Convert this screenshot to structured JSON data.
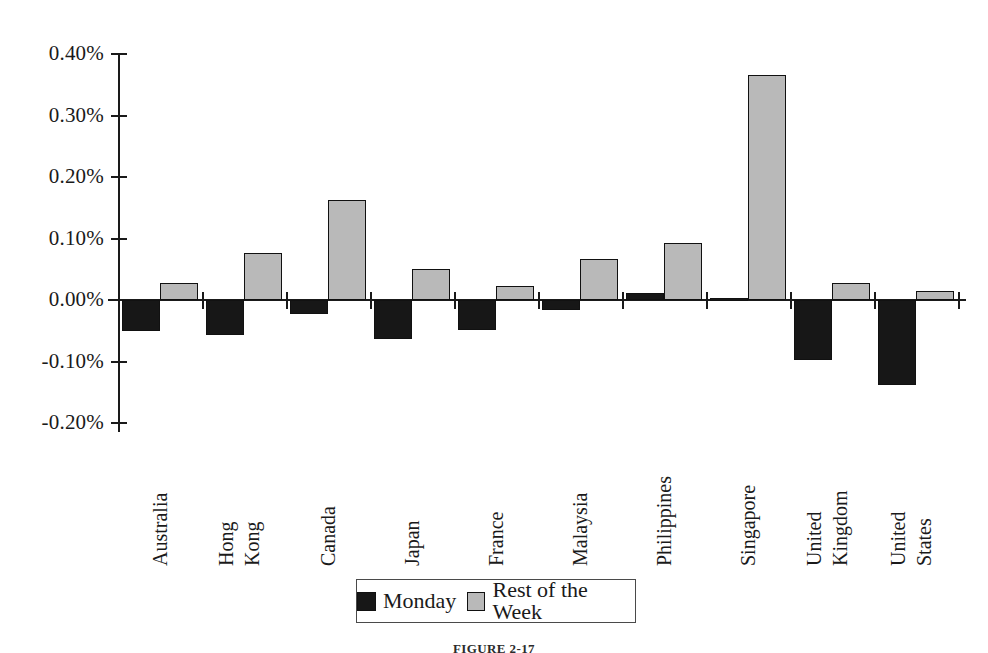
{
  "chart_data": {
    "type": "bar",
    "title": "",
    "subtitle": "",
    "xlabel": "",
    "ylabel": "",
    "grid": false,
    "legend_position": "bottom",
    "ylim": [
      -0.2,
      0.4
    ],
    "ytick_labels": [
      "0.40%",
      "0.30%",
      "0.20%",
      "0.10%",
      "0.00%",
      "-0.10%",
      "-0.20%"
    ],
    "ytick_values": [
      0.4,
      0.3,
      0.2,
      0.1,
      0.0,
      -0.1,
      -0.2
    ],
    "value_unit": "%",
    "categories": [
      "Australia",
      "Hong Kong",
      "Canada",
      "Japan",
      "France",
      "Malaysia",
      "Philippines",
      "Singapore",
      "United Kingdom",
      "United States"
    ],
    "category_lines": [
      [
        "Australia"
      ],
      [
        "Hong",
        "Kong"
      ],
      [
        "Canada"
      ],
      [
        "Japan"
      ],
      [
        "France"
      ],
      [
        "Malaysia"
      ],
      [
        "Philippines"
      ],
      [
        "Singapore"
      ],
      [
        "United",
        "Kingdom"
      ],
      [
        "United",
        "States"
      ]
    ],
    "series": [
      {
        "name": "Monday",
        "color": "#171717",
        "values": [
          -0.05,
          -0.057,
          -0.022,
          -0.063,
          -0.048,
          -0.017,
          0.011,
          0.004,
          -0.098,
          -0.138
        ]
      },
      {
        "name": "Rest of the Week",
        "color": "#b9b9b9",
        "values": [
          0.028,
          0.076,
          0.163,
          0.051,
          0.023,
          0.067,
          0.093,
          0.366,
          0.028,
          0.015
        ]
      }
    ]
  },
  "legend": {
    "items": [
      {
        "label": "Monday",
        "swatch": "monday-swatch"
      },
      {
        "label": "Rest of the Week",
        "swatch": "rest-of-week-swatch"
      }
    ]
  },
  "caption": {
    "text": "FIGURE 2-17"
  }
}
